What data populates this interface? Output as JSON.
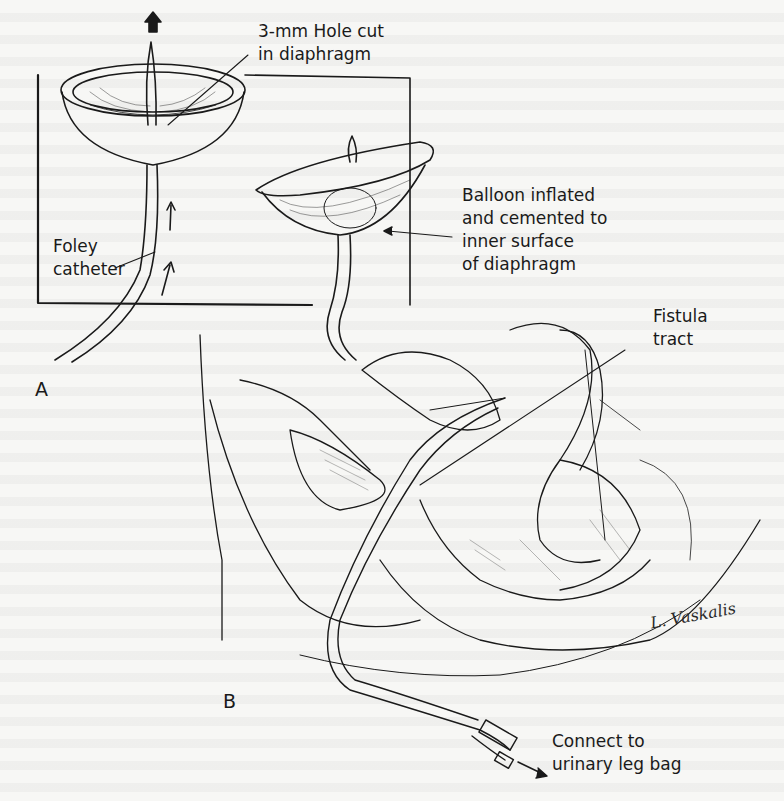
{
  "figure": {
    "panel_a": {
      "letter": "A",
      "labels": {
        "hole": "3-mm Hole cut\nin diaphragm",
        "catheter": "Foley\ncatheter",
        "balloon": "Balloon inflated\nand cemented to\ninner surface\nof diaphragm"
      }
    },
    "panel_b": {
      "letter": "B",
      "labels": {
        "fistula": "Fistula\ntract",
        "connect": "Connect to\nurinary leg bag"
      }
    },
    "signature": "L. Vaskalis"
  },
  "colors": {
    "paper": "#f7f7f5",
    "ink": "#1a1a1a"
  }
}
